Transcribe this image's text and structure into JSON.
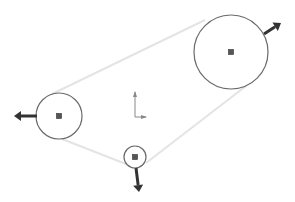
{
  "sketch": {
    "background": "#ffffff",
    "circle_stroke": "#6a6a6a",
    "tangent_stroke": "#e4e4e4",
    "center_fill": "#555555",
    "arrow_fill": "#333333",
    "circles": [
      {
        "name": "large-pulley",
        "cx": 231,
        "cy": 52,
        "r": 37
      },
      {
        "name": "left-pulley",
        "cx": 59,
        "cy": 116,
        "r": 23
      },
      {
        "name": "small-pulley",
        "cx": 135,
        "cy": 157,
        "r": 11
      }
    ],
    "tangents": [
      {
        "x1": 52,
        "y1": 94,
        "x2": 205,
        "y2": 20
      },
      {
        "x1": 62,
        "y1": 139,
        "x2": 126,
        "y2": 164
      },
      {
        "x1": 146,
        "y1": 163,
        "x2": 246,
        "y2": 86
      }
    ],
    "drag_arrows": [
      {
        "name": "large-pulley-drag-arrow",
        "x1": 264,
        "y1": 34,
        "x2": 281,
        "y2": 23
      },
      {
        "name": "left-pulley-drag-arrow",
        "x1": 37,
        "y1": 116,
        "x2": 14,
        "y2": 116
      },
      {
        "name": "small-pulley-drag-arrow",
        "x1": 136,
        "y1": 168,
        "x2": 139,
        "y2": 192
      }
    ],
    "origin": {
      "x": 135,
      "y": 117,
      "len_y": 25,
      "len_x": 11
    }
  }
}
